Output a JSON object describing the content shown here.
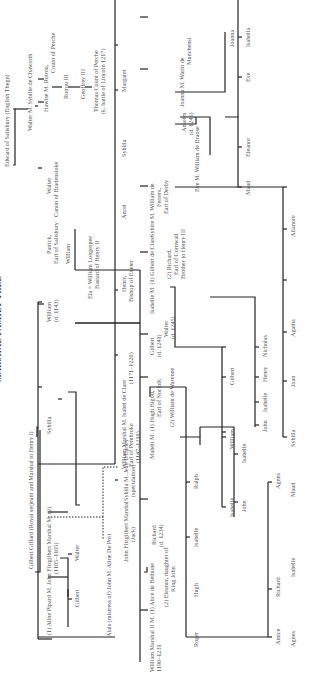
{
  "title": "MARSHAL FAMILY TREE",
  "people": {
    "edward": "Edward of Salisbury (English Thegn)",
    "walter_m_sybille": "Walter  M.  Sybille de Chaworth",
    "hawise": "Hawise  M.  Rotrou,",
    "rotrou_title": "Count of Perche",
    "rotrou3": "Rotrou III",
    "geoffrey3": "Geoffrey III",
    "thomas": "Thomas Count of Perche",
    "thomas_note": "(k. battle of Lincoln 1217)",
    "walter_canon": "Walter",
    "walter_canon_title": "Canon of Bradenstoke",
    "patrick": "Patrick,",
    "patrick_title": "Earl of Salisbury",
    "william_son": "William",
    "ela": "Ela  =  William Longespee",
    "ela_note": "Bastard of Henry II",
    "william_d1143": "William",
    "william_d1143_note": "(d. 1143)",
    "sybilla_m2": "Sybilla",
    "gilbert_giffard": "Gilbert Giffard (Royal serjeant and Marshal to Henry I)",
    "aline_pipard": "(1)  Aline Pipard  M.  John Fitzgilbert Marshal  M. (2)",
    "john_dates": "(1105–1165)",
    "gilbert": "Gilbert",
    "walter": "Walter",
    "margaret": "Margaret",
    "sybilla": "Sybilla",
    "ancel": "Ancel",
    "henry_bishop": "Henry,",
    "henry_bishop_title": "Bishop of Exeter",
    "william_marshal": "William Marshal  M.  Isabel de Clare",
    "william_marshal_title": "Earl of Pembroke",
    "william_marshal_dates": "(1147–1219)",
    "isabel_dates": "(1171–1220)",
    "alais": "Alais (mistress of) John  M.  Aline De Port",
    "john_fitz": "John Fitzgilbert Marshal",
    "john_fitz_note": "(Jack)",
    "sybilla_jean": "Sybilla  M.  Jean D'Earley",
    "speculation": "(speculation)",
    "wm2": "William Marshal II  M.  (1)  Alice de Béthune",
    "wm2_dates": "1190–1231",
    "eleanor": "(2)  Eleanor, daughter of",
    "eleanor2": "King John",
    "richard_1234": "Richard",
    "richard_1234_note": "(d. 1234)",
    "mahelt": "Mahelt  M.  (1)  Hugh Bigod,",
    "bigod_title": "Earl of Norfolk",
    "warenne": "(2)  William de Warenne",
    "gilbert_1241": "Gilbert",
    "gilbert_1241_note": "(d. 1241)",
    "walter_1245": "Walter",
    "walter_1245_note": "(d. 1245)",
    "isabelle_m": "Isabelle  M.  (1)  Gilbert de Clare",
    "richard_cornwall": "(2)  Richard,",
    "richard_cornwall2": "Earl of Cornwall",
    "richard_cornwall3": "Brother to Henry III",
    "sybire": "Sybire  M.  William de",
    "ferrers2": "Ferrers,",
    "ferrers3": "Earl of Derby",
    "eve_m": "Eve  M.  William de Braose",
    "anselm": "Anselm",
    "anselm_note": "(d. 1245)",
    "joanna_m": "Joanna  M.  Warin de",
    "munchensi": "Munchensi",
    "joanna_child": "Joanna",
    "maud": "Maud",
    "eleanor_c": "Eleanor",
    "eve_c": "Eve",
    "isabella_c": "Isabella",
    "roger": "Roger",
    "hugh": "Hugh",
    "isabelle_b": "Isabelle",
    "ralph": "Ralph",
    "john_b": "John",
    "isabelle_w": "Isabelle",
    "amice": "Amice",
    "richard_c": "Richard",
    "agnes_c": "Agnes",
    "isabelle_c": "Isabelle",
    "william_c": "William",
    "gilbert_c": "Gilbert",
    "john_c": "John",
    "isabelle_c2": "Isabelle",
    "henry_c": "Henry",
    "nicholas_c": "Nicholas",
    "agnes_f": "Agnes",
    "isabelle_f": "Isabelle",
    "maud_f": "Maud",
    "sybilla_f": "Sybilla",
    "joan_f": "Joan",
    "agatha_f": "Agatha",
    "alianore_f": "Alianore"
  }
}
